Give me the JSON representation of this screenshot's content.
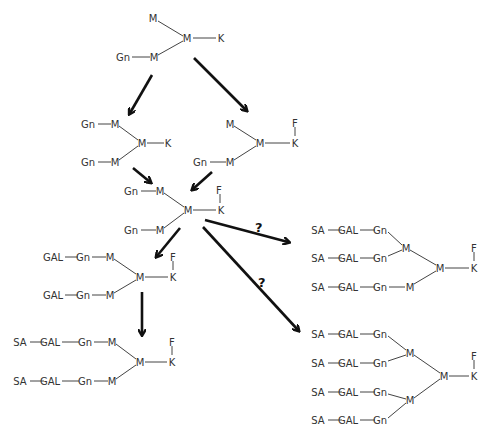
{
  "diagram": {
    "type": "glycan biosynthesis pathway",
    "legend_abbreviations": [
      "M",
      "K",
      "F",
      "Gn",
      "GAL",
      "SA"
    ],
    "structures": [
      {
        "id": "s1",
        "residues": [
          {
            "label": "M",
            "x": 153,
            "y": 18
          },
          {
            "label": "M",
            "x": 187,
            "y": 38
          },
          {
            "label": "K",
            "x": 221,
            "y": 38
          },
          {
            "label": "Gn",
            "x": 123,
            "y": 57
          },
          {
            "label": "M",
            "x": 154,
            "y": 57
          }
        ]
      },
      {
        "id": "s2",
        "residues": [
          {
            "label": "Gn",
            "x": 88,
            "y": 124
          },
          {
            "label": "M",
            "x": 115,
            "y": 124
          },
          {
            "label": "M",
            "x": 142,
            "y": 143
          },
          {
            "label": "K",
            "x": 168,
            "y": 143
          },
          {
            "label": "Gn",
            "x": 88,
            "y": 162
          },
          {
            "label": "M",
            "x": 115,
            "y": 162
          }
        ]
      },
      {
        "id": "s3",
        "residues": [
          {
            "label": "M",
            "x": 230,
            "y": 124
          },
          {
            "label": "M",
            "x": 260,
            "y": 143
          },
          {
            "label": "F",
            "x": 295,
            "y": 123
          },
          {
            "label": "K",
            "x": 295,
            "y": 143
          },
          {
            "label": "Gn",
            "x": 200,
            "y": 162
          },
          {
            "label": "M",
            "x": 230,
            "y": 162
          }
        ]
      },
      {
        "id": "s4",
        "residues": [
          {
            "label": "Gn",
            "x": 131,
            "y": 191
          },
          {
            "label": "M",
            "x": 160,
            "y": 191
          },
          {
            "label": "M",
            "x": 188,
            "y": 210
          },
          {
            "label": "F",
            "x": 219,
            "y": 190
          },
          {
            "label": "K",
            "x": 221,
            "y": 210
          },
          {
            "label": "Gn",
            "x": 131,
            "y": 230
          },
          {
            "label": "M",
            "x": 160,
            "y": 230
          }
        ]
      },
      {
        "id": "s5",
        "residues": [
          {
            "label": "GAL",
            "x": 53,
            "y": 257
          },
          {
            "label": "Gn",
            "x": 83,
            "y": 257
          },
          {
            "label": "M",
            "x": 110,
            "y": 257
          },
          {
            "label": "M",
            "x": 140,
            "y": 277
          },
          {
            "label": "F",
            "x": 173,
            "y": 257
          },
          {
            "label": "K",
            "x": 173,
            "y": 277
          },
          {
            "label": "GAL",
            "x": 53,
            "y": 295
          },
          {
            "label": "Gn",
            "x": 83,
            "y": 295
          },
          {
            "label": "M",
            "x": 110,
            "y": 295
          }
        ]
      },
      {
        "id": "s6",
        "residues": [
          {
            "label": "SA",
            "x": 20,
            "y": 342
          },
          {
            "label": "GAL",
            "x": 50,
            "y": 342
          },
          {
            "label": "Gn",
            "x": 85,
            "y": 342
          },
          {
            "label": "M",
            "x": 112,
            "y": 342
          },
          {
            "label": "M",
            "x": 140,
            "y": 362
          },
          {
            "label": "F",
            "x": 172,
            "y": 342
          },
          {
            "label": "K",
            "x": 172,
            "y": 362
          },
          {
            "label": "SA",
            "x": 20,
            "y": 381
          },
          {
            "label": "GAL",
            "x": 50,
            "y": 381
          },
          {
            "label": "Gn",
            "x": 85,
            "y": 381
          },
          {
            "label": "M",
            "x": 112,
            "y": 381
          }
        ]
      },
      {
        "id": "s7",
        "residues": [
          {
            "label": "SA",
            "x": 318,
            "y": 230
          },
          {
            "label": "GAL",
            "x": 348,
            "y": 230
          },
          {
            "label": "Gn",
            "x": 380,
            "y": 230
          },
          {
            "label": "M",
            "x": 406,
            "y": 248
          },
          {
            "label": "SA",
            "x": 318,
            "y": 258
          },
          {
            "label": "GAL",
            "x": 348,
            "y": 258
          },
          {
            "label": "Gn",
            "x": 380,
            "y": 258
          },
          {
            "label": "M",
            "x": 440,
            "y": 268
          },
          {
            "label": "F",
            "x": 474,
            "y": 248
          },
          {
            "label": "K",
            "x": 474,
            "y": 268
          },
          {
            "label": "SA",
            "x": 318,
            "y": 287
          },
          {
            "label": "GAL",
            "x": 348,
            "y": 287
          },
          {
            "label": "Gn",
            "x": 380,
            "y": 287
          },
          {
            "label": "M",
            "x": 410,
            "y": 287
          }
        ]
      },
      {
        "id": "s8",
        "residues": [
          {
            "label": "SA",
            "x": 318,
            "y": 334
          },
          {
            "label": "GAL",
            "x": 348,
            "y": 334
          },
          {
            "label": "Gn",
            "x": 380,
            "y": 334
          },
          {
            "label": "M",
            "x": 410,
            "y": 353
          },
          {
            "label": "SA",
            "x": 318,
            "y": 363
          },
          {
            "label": "GAL",
            "x": 348,
            "y": 363
          },
          {
            "label": "Gn",
            "x": 380,
            "y": 363
          },
          {
            "label": "M",
            "x": 444,
            "y": 376
          },
          {
            "label": "F",
            "x": 474,
            "y": 356
          },
          {
            "label": "K",
            "x": 474,
            "y": 376
          },
          {
            "label": "SA",
            "x": 318,
            "y": 392
          },
          {
            "label": "GAL",
            "x": 348,
            "y": 392
          },
          {
            "label": "Gn",
            "x": 380,
            "y": 392
          },
          {
            "label": "M",
            "x": 410,
            "y": 400
          },
          {
            "label": "SA",
            "x": 318,
            "y": 420
          },
          {
            "label": "GAL",
            "x": 348,
            "y": 420
          },
          {
            "label": "Gn",
            "x": 380,
            "y": 420
          }
        ]
      }
    ],
    "arrows": [
      {
        "from": "s1",
        "to": "s2",
        "uncertain": false,
        "label": ""
      },
      {
        "from": "s1",
        "to": "s3",
        "uncertain": false,
        "label": ""
      },
      {
        "from": "s2",
        "to": "s4",
        "uncertain": false,
        "label": ""
      },
      {
        "from": "s3",
        "to": "s4",
        "uncertain": false,
        "label": ""
      },
      {
        "from": "s4",
        "to": "s5",
        "uncertain": false,
        "label": ""
      },
      {
        "from": "s5",
        "to": "s6",
        "uncertain": false,
        "label": ""
      },
      {
        "from": "s4",
        "to": "s7",
        "uncertain": true,
        "label": "?"
      },
      {
        "from": "s4",
        "to": "s8",
        "uncertain": true,
        "label": "?"
      }
    ]
  },
  "labels": {
    "q1": "?",
    "q2": "?"
  }
}
